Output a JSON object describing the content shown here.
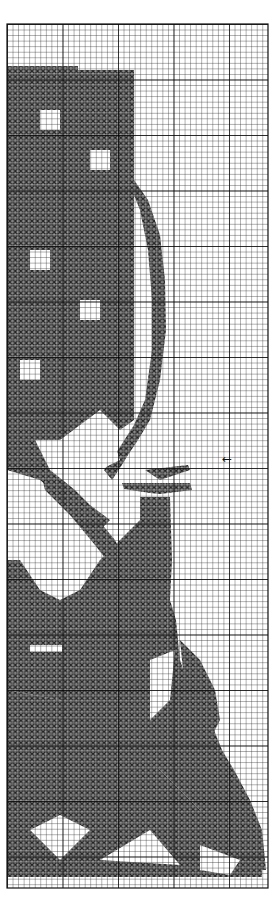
{
  "pattern": {
    "type": "cross-stitch chart",
    "grid": {
      "x": 7,
      "y": 24,
      "width": 261,
      "height": 864,
      "cell": 5.55,
      "major_every": 10,
      "line_color": "#222222",
      "major_line_color": "#000000"
    },
    "stitch_color": "#3a3a3a",
    "background": "#ffffff",
    "regions": [
      {
        "name": "tree-canopy-block",
        "points": "7,66 78,66 78,70 134,70 134,420 120,430 100,410 60,440 7,440"
      },
      {
        "name": "branch-arc",
        "points": "134,180 148,200 160,235 165,280 166,330 160,380 150,420 138,440 128,455 120,468 112,480 104,470 118,450 134,425 145,400 152,350 152,300 148,250 140,210 134,195"
      },
      {
        "name": "branch-lower-left",
        "points": "7,440 30,430 50,470 75,490 90,505 110,520 100,530 70,505 40,480 7,470"
      },
      {
        "name": "branch-diagonal",
        "points": "40,470 60,480 90,510 115,540 130,570 118,575 95,545 70,515 45,490"
      },
      {
        "name": "bird-perch",
        "points": "122,483 190,483 192,490 160,494 150,493 124,489"
      },
      {
        "name": "bird-head",
        "points": "145,470 188,465 190,470 160,480"
      },
      {
        "name": "bird-body",
        "points": "140,497 170,497 172,560 170,600 176,620 180,660 190,690 210,720 222,750 234,770 250,800 262,830 266,870 240,870 200,810 160,770 120,740 90,720 60,700 7,690 7,560 20,560 40,590 60,600 80,590 100,560 120,540 140,520"
      },
      {
        "name": "bird-tail",
        "points": "180,640 200,660 215,690 220,720 210,740 195,720 185,690"
      },
      {
        "name": "foliage-base",
        "points": "7,690 60,700 110,730 160,770 200,810 240,850 262,870 262,877 7,877"
      }
    ],
    "highlights": [
      {
        "name": "leaf-gap",
        "points": "40,110 60,110 60,130 40,130"
      },
      {
        "name": "leaf-gap",
        "points": "90,150 110,150 110,170 90,170"
      },
      {
        "name": "leaf-gap",
        "points": "30,250 50,250 50,270 30,270"
      },
      {
        "name": "leaf-gap",
        "points": "80,300 100,300 100,320 80,320"
      },
      {
        "name": "leaf-gap",
        "points": "20,360 40,360 40,380 20,380"
      },
      {
        "name": "sky-gap",
        "points": "60,450 110,430 120,460 80,480"
      },
      {
        "name": "body-gap",
        "points": "30,645 62,645 62,652 30,652"
      },
      {
        "name": "wing-gap",
        "points": "150,660 175,650 170,700 150,720"
      },
      {
        "name": "base-gap",
        "points": "30,830 60,860 90,830 60,815"
      },
      {
        "name": "base-gap",
        "points": "100,860 150,830 180,865"
      },
      {
        "name": "base-gap",
        "points": "200,845 240,860 230,875 200,870"
      }
    ],
    "marker": {
      "symbol": "←",
      "x": 222,
      "y": 453,
      "label": "center-row-marker"
    }
  }
}
